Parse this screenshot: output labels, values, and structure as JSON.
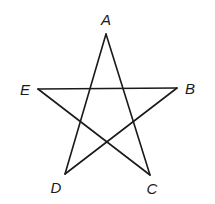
{
  "diagram": {
    "type": "pentagram",
    "vertices": [
      {
        "name": "A",
        "x": 106,
        "y": 34,
        "label_x": 106,
        "label_y": 25
      },
      {
        "name": "B",
        "x": 177,
        "y": 88,
        "label_x": 190,
        "label_y": 94
      },
      {
        "name": "C",
        "x": 150,
        "y": 175,
        "label_x": 152,
        "label_y": 194
      },
      {
        "name": "D",
        "x": 65,
        "y": 174,
        "label_x": 56,
        "label_y": 193
      },
      {
        "name": "E",
        "x": 38,
        "y": 89,
        "label_x": 25,
        "label_y": 95
      }
    ],
    "edges": [
      [
        "A",
        "C"
      ],
      [
        "A",
        "D"
      ],
      [
        "E",
        "B"
      ],
      [
        "E",
        "C"
      ],
      [
        "B",
        "D"
      ]
    ],
    "colors": {
      "stroke": "#1a1a1a",
      "background": "#ffffff"
    }
  }
}
